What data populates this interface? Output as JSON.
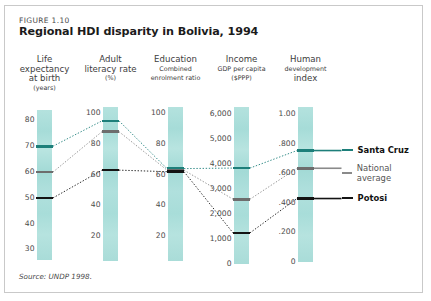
{
  "figure": {
    "label": "FIGURE 1.10",
    "title": "Regional HDI disparity in Bolivia, 1994",
    "source": "Source: UNDP 1998."
  },
  "legend": {
    "position": "right",
    "items": [
      {
        "label": "Santa Cruz",
        "color": "#1d7f7a",
        "weight": "bold"
      },
      {
        "label": "National average",
        "color": "#8a8a8a",
        "weight": "normal"
      },
      {
        "label": "Potosi",
        "color": "#141414",
        "weight": "bold"
      }
    ]
  },
  "columns": [
    {
      "title": "Life\nexpectancy\nat birth",
      "title_line1": "Life",
      "title_line2": "expectancy",
      "title_line3": "at birth",
      "unit": "(years)",
      "ticks": [
        "80",
        "70",
        "60",
        "50",
        "40",
        "30"
      ]
    },
    {
      "title_line1": "Adult",
      "title_line2": "literacy rate",
      "title_line3": "",
      "unit": "(%)",
      "ticks": [
        "100",
        "80",
        "60",
        "40",
        "20"
      ]
    },
    {
      "title_line1": "Education",
      "title_line2": "Combined",
      "title_line3": "enrolment ratio",
      "unit": "",
      "ticks": [
        "100",
        "80",
        "60",
        "40",
        "20"
      ]
    },
    {
      "title_line1": "Income",
      "title_line2": "GDP per capita",
      "title_line3": "($PPP)",
      "unit": "",
      "ticks": [
        "6,000",
        "5,000",
        "4,000",
        "3,000",
        "2,000",
        "1,000",
        "0"
      ]
    },
    {
      "title_line1": "Human",
      "title_line2": "development",
      "title_line3": "index",
      "unit": "",
      "ticks": [
        "1.00",
        ".800",
        ".600",
        ".400",
        ".200",
        "0"
      ]
    }
  ],
  "chart_data": {
    "type": "line",
    "title": "Regional HDI disparity in Bolivia, 1994",
    "subtitle": "FIGURE 1.10",
    "xlabel": "",
    "ylabel": "",
    "grid": false,
    "legend_position": "right",
    "note": "Parallel-coordinates style chart: five independently scaled vertical axes, three regional series connected by dotted lines.",
    "categories": [
      "Life expectancy at birth (years)",
      "Adult literacy rate (%)",
      "Education combined enrolment ratio",
      "Income GDP per capita ($PPP)",
      "Human development index"
    ],
    "axes": [
      {
        "name": "Life expectancy at birth",
        "unit": "years",
        "ticks": [
          80,
          70,
          60,
          50,
          40,
          30
        ],
        "range": [
          26,
          84
        ]
      },
      {
        "name": "Adult literacy rate",
        "unit": "%",
        "ticks": [
          100,
          80,
          60,
          40,
          20
        ],
        "range": [
          4,
          104
        ]
      },
      {
        "name": "Education combined enrolment ratio",
        "unit": "",
        "ticks": [
          100,
          80,
          60,
          40,
          20
        ],
        "range": [
          4,
          104
        ]
      },
      {
        "name": "Income GDP per capita",
        "unit": "$PPP",
        "ticks": [
          6000,
          5000,
          4000,
          3000,
          2000,
          1000,
          0
        ],
        "range": [
          0,
          6300
        ]
      },
      {
        "name": "Human development index",
        "unit": "",
        "ticks": [
          1.0,
          0.8,
          0.6,
          0.4,
          0.2,
          0.0
        ],
        "range": [
          0,
          1.05
        ]
      }
    ],
    "series": [
      {
        "name": "Santa Cruz",
        "color": "#1d7f7a",
        "values": [
          70,
          95,
          64,
          3850,
          0.755
        ]
      },
      {
        "name": "National average",
        "color": "#8a8a8a",
        "values": [
          60,
          88,
          63,
          2600,
          0.635
        ]
      },
      {
        "name": "Potosi",
        "color": "#141414",
        "values": [
          50,
          63,
          62,
          1250,
          0.43
        ]
      }
    ]
  }
}
